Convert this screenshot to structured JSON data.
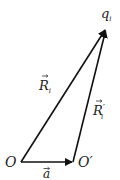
{
  "diagram": {
    "points": {
      "O": {
        "label": "O",
        "x": 21,
        "y": 162
      },
      "O_prime": {
        "label": "O′",
        "x": 73,
        "y": 162
      },
      "q": {
        "label": "q",
        "sub": "i",
        "x": 106,
        "y": 28
      }
    },
    "vectors": [
      {
        "id": "R_i",
        "label": "R",
        "sub": "i",
        "from": "O",
        "to": "q"
      },
      {
        "id": "R_i_prime",
        "label": "R",
        "sub": "i",
        "prime": "′",
        "from": "O_prime",
        "to": "q"
      },
      {
        "id": "a",
        "label": "a",
        "from": "O",
        "to": "O_prime"
      }
    ],
    "colors": {
      "stroke": "#111111",
      "text": "#222222"
    }
  }
}
